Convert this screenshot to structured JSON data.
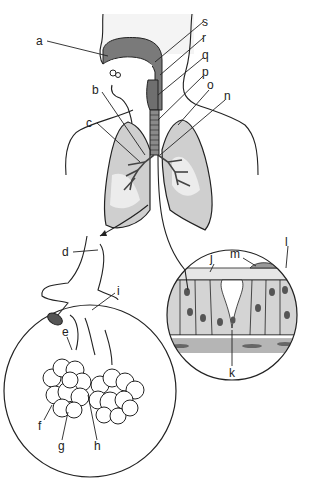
{
  "colors": {
    "background": "#ffffff",
    "outline": "#222222",
    "tissue_dark": "#7a7a7a",
    "lung_fill": "#cfcfcf",
    "lung_light": "#ececec",
    "cell_fill": "#d4d4d4",
    "nucleus": "#555555"
  },
  "labels": [
    {
      "id": "a",
      "text": "a"
    },
    {
      "id": "b",
      "text": "b"
    },
    {
      "id": "c",
      "text": "c"
    },
    {
      "id": "d",
      "text": "d"
    },
    {
      "id": "e",
      "text": "e"
    },
    {
      "id": "f",
      "text": "f"
    },
    {
      "id": "g",
      "text": "g"
    },
    {
      "id": "h",
      "text": "h"
    },
    {
      "id": "i",
      "text": "i"
    },
    {
      "id": "j",
      "text": "j"
    },
    {
      "id": "k",
      "text": "k"
    },
    {
      "id": "l",
      "text": "l"
    },
    {
      "id": "m",
      "text": "m"
    },
    {
      "id": "n",
      "text": "n"
    },
    {
      "id": "o",
      "text": "o"
    },
    {
      "id": "p",
      "text": "p"
    },
    {
      "id": "q",
      "text": "q"
    },
    {
      "id": "r",
      "text": "r"
    },
    {
      "id": "s",
      "text": "s"
    }
  ],
  "insets": [
    {
      "name": "alveoli-detail",
      "description": "bronchiole and alveolar sacs"
    },
    {
      "name": "epithelium-detail",
      "description": "ciliated epithelium with mucus"
    }
  ]
}
